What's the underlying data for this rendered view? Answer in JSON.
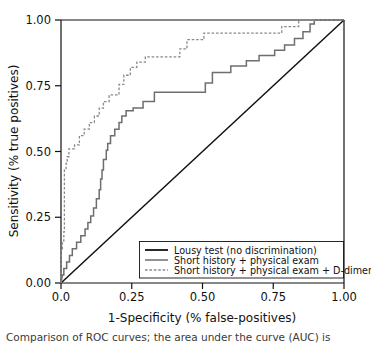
{
  "figure": {
    "name": "roc-curve-figure",
    "background": "#ffffff",
    "caption_partial": "Comparison of ROC curves; the area under the curve (AUC) is"
  },
  "chart_data": {
    "type": "line",
    "title": "",
    "subtitle": "",
    "xlabel": "1-Specificity (% false-positives)",
    "ylabel": "Sensitivity (% true positives)",
    "xlim": [
      0.0,
      1.0
    ],
    "ylim": [
      0.0,
      1.0
    ],
    "grid": false,
    "legend_position": "lower right",
    "xticks": [
      0.0,
      0.25,
      0.5,
      0.75,
      1.0
    ],
    "xtick_labels": [
      "0.00",
      "0.25",
      "0.50",
      "0.75",
      "1.00"
    ],
    "xtick_labels_display": [
      "0.0",
      "0.25",
      "0.50",
      "0.75",
      "1.00"
    ],
    "yticks": [
      0.0,
      0.25,
      0.5,
      0.75,
      1.0
    ],
    "ytick_labels": [
      "0.00",
      "0.25",
      "0.50",
      "0.75",
      "1.00"
    ],
    "series": [
      {
        "name": "Lousy test (no discrimination)",
        "style": "solid",
        "color": "#111111",
        "width": 1.5,
        "auc": 0.5,
        "points": [
          [
            0.0,
            0.0
          ],
          [
            1.0,
            1.0
          ]
        ]
      },
      {
        "name": "Short history + physical exam",
        "style": "solid",
        "color": "#6e6e6e",
        "width": 1.5,
        "points": [
          [
            0.0,
            0.0
          ],
          [
            0.005,
            0.03
          ],
          [
            0.01,
            0.03
          ],
          [
            0.01,
            0.055
          ],
          [
            0.02,
            0.055
          ],
          [
            0.02,
            0.08
          ],
          [
            0.03,
            0.08
          ],
          [
            0.03,
            0.105
          ],
          [
            0.04,
            0.105
          ],
          [
            0.04,
            0.13
          ],
          [
            0.055,
            0.13
          ],
          [
            0.055,
            0.155
          ],
          [
            0.07,
            0.155
          ],
          [
            0.07,
            0.18
          ],
          [
            0.085,
            0.18
          ],
          [
            0.085,
            0.205
          ],
          [
            0.095,
            0.205
          ],
          [
            0.095,
            0.23
          ],
          [
            0.105,
            0.23
          ],
          [
            0.105,
            0.255
          ],
          [
            0.115,
            0.255
          ],
          [
            0.115,
            0.285
          ],
          [
            0.125,
            0.285
          ],
          [
            0.125,
            0.32
          ],
          [
            0.135,
            0.32
          ],
          [
            0.135,
            0.355
          ],
          [
            0.14,
            0.355
          ],
          [
            0.14,
            0.395
          ],
          [
            0.145,
            0.395
          ],
          [
            0.145,
            0.43
          ],
          [
            0.15,
            0.43
          ],
          [
            0.15,
            0.47
          ],
          [
            0.16,
            0.47
          ],
          [
            0.16,
            0.505
          ],
          [
            0.165,
            0.505
          ],
          [
            0.165,
            0.53
          ],
          [
            0.175,
            0.53
          ],
          [
            0.175,
            0.56
          ],
          [
            0.19,
            0.56
          ],
          [
            0.19,
            0.585
          ],
          [
            0.205,
            0.585
          ],
          [
            0.205,
            0.61
          ],
          [
            0.215,
            0.61
          ],
          [
            0.215,
            0.635
          ],
          [
            0.23,
            0.635
          ],
          [
            0.23,
            0.655
          ],
          [
            0.255,
            0.655
          ],
          [
            0.255,
            0.665
          ],
          [
            0.29,
            0.665
          ],
          [
            0.29,
            0.69
          ],
          [
            0.33,
            0.69
          ],
          [
            0.33,
            0.725
          ],
          [
            0.51,
            0.725
          ],
          [
            0.51,
            0.76
          ],
          [
            0.535,
            0.76
          ],
          [
            0.535,
            0.8
          ],
          [
            0.6,
            0.8
          ],
          [
            0.6,
            0.825
          ],
          [
            0.655,
            0.825
          ],
          [
            0.655,
            0.845
          ],
          [
            0.7,
            0.845
          ],
          [
            0.7,
            0.865
          ],
          [
            0.755,
            0.865
          ],
          [
            0.755,
            0.885
          ],
          [
            0.79,
            0.885
          ],
          [
            0.79,
            0.905
          ],
          [
            0.825,
            0.905
          ],
          [
            0.825,
            0.93
          ],
          [
            0.855,
            0.93
          ],
          [
            0.855,
            0.955
          ],
          [
            0.88,
            0.955
          ],
          [
            0.88,
            0.985
          ],
          [
            0.895,
            0.985
          ],
          [
            0.895,
            1.0
          ],
          [
            1.0,
            1.0
          ]
        ]
      },
      {
        "name": "Short history + physical exam + D-dimer",
        "style": "dashed",
        "color": "#8a8a8a",
        "width": 1.3,
        "points": [
          [
            0.0,
            0.0
          ],
          [
            0.0,
            0.13
          ],
          [
            0.005,
            0.13
          ],
          [
            0.005,
            0.16
          ],
          [
            0.01,
            0.16
          ],
          [
            0.01,
            0.195
          ],
          [
            0.012,
            0.195
          ],
          [
            0.012,
            0.43
          ],
          [
            0.018,
            0.43
          ],
          [
            0.018,
            0.455
          ],
          [
            0.022,
            0.455
          ],
          [
            0.022,
            0.48
          ],
          [
            0.028,
            0.48
          ],
          [
            0.028,
            0.51
          ],
          [
            0.048,
            0.51
          ],
          [
            0.048,
            0.525
          ],
          [
            0.065,
            0.525
          ],
          [
            0.065,
            0.56
          ],
          [
            0.082,
            0.56
          ],
          [
            0.082,
            0.585
          ],
          [
            0.1,
            0.585
          ],
          [
            0.1,
            0.61
          ],
          [
            0.118,
            0.61
          ],
          [
            0.118,
            0.635
          ],
          [
            0.135,
            0.635
          ],
          [
            0.135,
            0.665
          ],
          [
            0.15,
            0.665
          ],
          [
            0.15,
            0.69
          ],
          [
            0.17,
            0.69
          ],
          [
            0.17,
            0.715
          ],
          [
            0.205,
            0.715
          ],
          [
            0.205,
            0.755
          ],
          [
            0.222,
            0.755
          ],
          [
            0.222,
            0.79
          ],
          [
            0.245,
            0.79
          ],
          [
            0.245,
            0.82
          ],
          [
            0.268,
            0.82
          ],
          [
            0.268,
            0.84
          ],
          [
            0.298,
            0.84
          ],
          [
            0.298,
            0.86
          ],
          [
            0.42,
            0.86
          ],
          [
            0.42,
            0.89
          ],
          [
            0.445,
            0.89
          ],
          [
            0.445,
            0.925
          ],
          [
            0.505,
            0.925
          ],
          [
            0.505,
            0.95
          ],
          [
            0.78,
            0.95
          ],
          [
            0.78,
            0.975
          ],
          [
            0.84,
            0.975
          ],
          [
            0.84,
            1.0
          ],
          [
            1.0,
            1.0
          ]
        ]
      }
    ]
  },
  "legend": {
    "name": "chart-legend",
    "entries": [
      {
        "label": "Lousy test (no discrimination)",
        "style": "solid",
        "color": "#111111"
      },
      {
        "label": "Short history + physical exam",
        "style": "solid",
        "color": "#6e6e6e"
      },
      {
        "label": "Short history + physical exam + D-dimer",
        "style": "dashed",
        "color": "#8a8a8a"
      }
    ]
  },
  "axes": {
    "x_title": "1-Specificity (% false-positives)",
    "y_title": "Sensitivity (% true positives)",
    "x_ticks": [
      "0.0",
      "0.25",
      "0.50",
      "0.75",
      "1.00"
    ],
    "y_ticks": [
      "0.00",
      "0.25",
      "0.50",
      "0.75",
      "1.00"
    ]
  }
}
